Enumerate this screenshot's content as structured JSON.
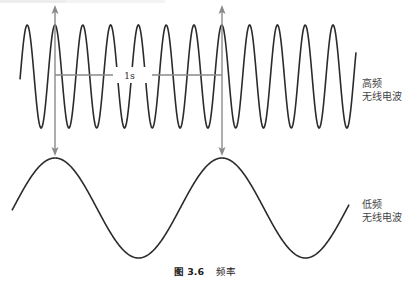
{
  "figure": {
    "caption_number": "图 3.6",
    "caption_title": "频率",
    "measure_label": "1s",
    "high_frequency_label": [
      "高频",
      "无线电波"
    ],
    "low_frequency_label": [
      "低频",
      "无线电波"
    ]
  },
  "waves": {
    "high": {
      "center_y": 76.5,
      "amplitude": 51.5,
      "period": 27.8,
      "first_peak_x": 55,
      "start_x": 20,
      "end_x": 356,
      "peak_count": 12
    },
    "low": {
      "center_y": 208,
      "amplitude": 50,
      "period": 167,
      "first_peak_x": 55,
      "start_x": 12,
      "end_x": 349
    }
  },
  "markers": {
    "arrow_x": [
      55,
      222
    ],
    "arrow_top_y": 5,
    "arrow_bottom_y": 156,
    "measure_y": 75,
    "measure_gap": [
      113,
      152
    ],
    "label_gap": [
      113,
      150
    ]
  },
  "colors": {
    "wave": "#2b2b2b",
    "guide": "#8a8a8a",
    "text": "#444444"
  }
}
